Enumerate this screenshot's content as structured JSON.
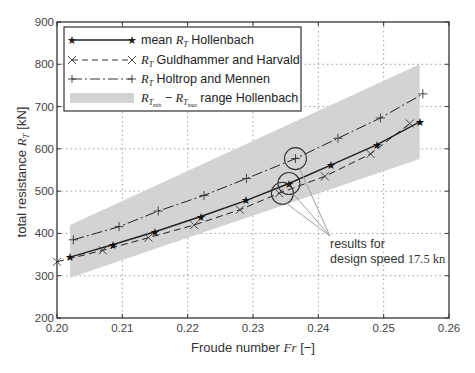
{
  "chart_data": {
    "type": "line",
    "title": "",
    "xlabel": "Froude number",
    "xlabel_symbol": "Fr",
    "xlabel_unit": "[−]",
    "ylabel": "total resistance",
    "ylabel_symbol": "R_T",
    "ylabel_unit": "[kN]",
    "xlim": [
      0.2,
      0.26
    ],
    "ylim": [
      200,
      900
    ],
    "xticks": [
      0.2,
      0.21,
      0.22,
      0.23,
      0.24,
      0.25,
      0.26
    ],
    "xtick_labels": [
      "0.20",
      "0.21",
      "0.22",
      "0.23",
      "0.24",
      "0.25",
      "0.26"
    ],
    "yticks": [
      200,
      300,
      400,
      500,
      600,
      700,
      800,
      900
    ],
    "ytick_labels": [
      "200",
      "300",
      "400",
      "500",
      "600",
      "700",
      "800",
      "900"
    ],
    "grid": true,
    "grid_style": "dotted",
    "legend_position": "upper left",
    "series": [
      {
        "name": "mean R_T Hollenbach",
        "legend_label": "mean R_T Hollenbach",
        "style": "solid",
        "marker": "star",
        "x": [
          0.202,
          0.2085,
          0.215,
          0.222,
          0.229,
          0.2355,
          0.242,
          0.249,
          0.2555
        ],
        "y": [
          344,
          373,
          404,
          440,
          478,
          518,
          562,
          610,
          664
        ]
      },
      {
        "name": "R_T Guldhammer and Harvald",
        "legend_label": "R_T Guldhammer and Harvald",
        "style": "dashed",
        "marker": "x",
        "x": [
          0.2,
          0.207,
          0.214,
          0.221,
          0.228,
          0.234,
          0.241,
          0.248,
          0.254
        ],
        "y": [
          333,
          360,
          390,
          420,
          456,
          495,
          535,
          588,
          660
        ]
      },
      {
        "name": "R_T Holtrop and Mennen",
        "legend_label": "R_T Holtrop and Mennen",
        "style": "dashdot",
        "marker": "plus",
        "x": [
          0.2025,
          0.2095,
          0.2155,
          0.2225,
          0.229,
          0.2365,
          0.243,
          0.2495,
          0.256
        ],
        "y": [
          385,
          416,
          453,
          490,
          530,
          577,
          625,
          673,
          730
        ]
      },
      {
        "name": "R_Tmin - R_Tmax range Hollenbach",
        "legend_label": "range Hollenbach",
        "style": "band",
        "x": [
          0.202,
          0.2555
        ],
        "y_lower": [
          295,
          576
        ],
        "y_upper": [
          420,
          800
        ]
      }
    ],
    "annotations": [
      {
        "text_line1": "results for",
        "text_line2": "design speed",
        "value": "17.5 kn",
        "points": [
          [
            0.2345,
            495
          ],
          [
            0.2355,
            518
          ],
          [
            0.2365,
            577
          ]
        ]
      }
    ]
  },
  "labels": {
    "xlabel": "Froude number",
    "xsym": "Fr",
    "xunit": "[−]",
    "ylabel": "total resistance",
    "ysym": "R",
    "ysub": "T",
    "yunit": "[kN]",
    "legend": {
      "l1_pre": "mean ",
      "l1_post": " Hollenbach",
      "l2_post": "  Guldhammer and Harvald",
      "l3_post": "  Holtrop and Mennen",
      "l4_sub_min": "min",
      "l4_sub_max": "max",
      "l4_post": " range Hollenbach",
      "sym": "R",
      "sub": "T"
    },
    "annot_line1": "results for",
    "annot_line2": "design speed ",
    "annot_value": "17.5",
    "annot_unit": " kn"
  },
  "colors": {
    "band": "#d3d3d3",
    "line": "#222222",
    "grid": "#888888",
    "axis": "#333333",
    "annot_line": "#999999"
  }
}
